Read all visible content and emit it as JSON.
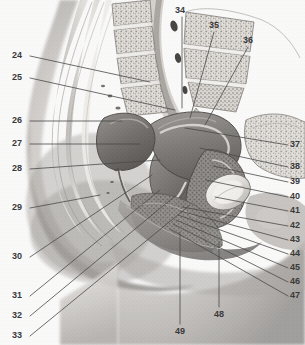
{
  "figure": {
    "type": "labeled-anatomical-illustration",
    "width": 305,
    "height": 345,
    "background_color": "#fcfcfc",
    "rendering": "grayscale halftone medical illustration",
    "leader_line_color": "#4a4a4a",
    "label_text_color": "#3a3a3a"
  },
  "labels": [
    {
      "id": "24",
      "text": "24",
      "x": 12,
      "y": 51,
      "side": "left",
      "line": [
        [
          30,
          56
        ],
        [
          150,
          82
        ]
      ]
    },
    {
      "id": "25",
      "text": "25",
      "x": 12,
      "y": 73,
      "side": "left",
      "line": [
        [
          30,
          78
        ],
        [
          175,
          110
        ]
      ]
    },
    {
      "id": "26",
      "text": "26",
      "x": 12,
      "y": 116,
      "side": "left",
      "line": [
        [
          30,
          121
        ],
        [
          122,
          121
        ]
      ]
    },
    {
      "id": "27",
      "text": "27",
      "x": 12,
      "y": 139,
      "side": "left",
      "line": [
        [
          30,
          144
        ],
        [
          140,
          144
        ]
      ]
    },
    {
      "id": "28",
      "text": "28",
      "x": 12,
      "y": 164,
      "side": "left",
      "line": [
        [
          30,
          169
        ],
        [
          160,
          160
        ]
      ]
    },
    {
      "id": "29",
      "text": "29",
      "x": 12,
      "y": 203,
      "side": "left",
      "line": [
        [
          30,
          208
        ],
        [
          100,
          195
        ]
      ]
    },
    {
      "id": "30",
      "text": "30",
      "x": 12,
      "y": 252,
      "side": "left",
      "line": [
        [
          30,
          257
        ],
        [
          152,
          175
        ]
      ]
    },
    {
      "id": "31",
      "text": "31",
      "x": 12,
      "y": 291,
      "side": "left",
      "line": [
        [
          30,
          296
        ],
        [
          160,
          190
        ]
      ]
    },
    {
      "id": "32",
      "text": "32",
      "x": 12,
      "y": 311,
      "side": "left",
      "line": [
        [
          30,
          316
        ],
        [
          175,
          196
        ]
      ]
    },
    {
      "id": "33",
      "text": "33",
      "x": 12,
      "y": 331,
      "side": "left",
      "line": [
        [
          30,
          336
        ],
        [
          190,
          205
        ]
      ]
    },
    {
      "id": "34",
      "text": "34",
      "x": 175,
      "y": 6,
      "side": "top",
      "line": [
        [
          182,
          17
        ],
        [
          182,
          108
        ]
      ]
    },
    {
      "id": "35",
      "text": "35",
      "x": 209,
      "y": 21,
      "side": "top",
      "line": [
        [
          214,
          32
        ],
        [
          190,
          118
        ]
      ]
    },
    {
      "id": "36",
      "text": "36",
      "x": 243,
      "y": 36,
      "side": "top",
      "line": [
        [
          248,
          47
        ],
        [
          205,
          125
        ]
      ]
    },
    {
      "id": "37",
      "text": "37",
      "x": 290,
      "y": 140,
      "side": "right",
      "line": [
        [
          288,
          145
        ],
        [
          185,
          128
        ]
      ]
    },
    {
      "id": "38",
      "text": "38",
      "x": 290,
      "y": 162,
      "side": "right",
      "line": [
        [
          288,
          167
        ],
        [
          200,
          148
        ]
      ]
    },
    {
      "id": "39",
      "text": "39",
      "x": 290,
      "y": 177,
      "side": "right",
      "line": [
        [
          288,
          182
        ],
        [
          213,
          166
        ]
      ]
    },
    {
      "id": "40",
      "text": "40",
      "x": 290,
      "y": 192,
      "side": "right",
      "line": [
        [
          288,
          197
        ],
        [
          206,
          180
        ]
      ]
    },
    {
      "id": "41",
      "text": "41",
      "x": 290,
      "y": 206,
      "side": "right",
      "line": [
        [
          288,
          211
        ],
        [
          215,
          197
        ]
      ]
    },
    {
      "id": "42",
      "text": "42",
      "x": 290,
      "y": 221,
      "side": "right",
      "line": [
        [
          288,
          226
        ],
        [
          182,
          207
        ]
      ]
    },
    {
      "id": "43",
      "text": "43",
      "x": 290,
      "y": 235,
      "side": "right",
      "line": [
        [
          288,
          240
        ],
        [
          180,
          211
        ]
      ]
    },
    {
      "id": "44",
      "text": "44",
      "x": 290,
      "y": 249,
      "side": "right",
      "line": [
        [
          288,
          254
        ],
        [
          178,
          215
        ]
      ]
    },
    {
      "id": "45",
      "text": "45",
      "x": 290,
      "y": 263,
      "side": "right",
      "line": [
        [
          288,
          268
        ],
        [
          176,
          220
        ]
      ]
    },
    {
      "id": "46",
      "text": "46",
      "x": 290,
      "y": 277,
      "side": "right",
      "line": [
        [
          288,
          282
        ],
        [
          173,
          224
        ]
      ]
    },
    {
      "id": "47",
      "text": "47",
      "x": 290,
      "y": 291,
      "side": "right",
      "line": [
        [
          288,
          296
        ],
        [
          170,
          229
        ]
      ]
    },
    {
      "id": "48",
      "text": "48",
      "x": 214,
      "y": 310,
      "side": "bottom",
      "line": [
        [
          219,
          307
        ],
        [
          219,
          242
        ]
      ]
    },
    {
      "id": "49",
      "text": "49",
      "x": 175,
      "y": 327,
      "side": "bottom",
      "line": [
        [
          180,
          324
        ],
        [
          180,
          232
        ]
      ]
    }
  ]
}
